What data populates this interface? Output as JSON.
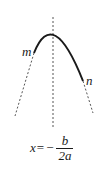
{
  "diagram": {
    "type": "parabola-axis-of-symmetry",
    "colors": {
      "curve": "#1a1a1a",
      "dashed": "#555555",
      "text": "#1a1a1a",
      "background": "#ffffff"
    },
    "labels": {
      "left_point": "m",
      "right_point": "n"
    },
    "axis_formula": {
      "lhs": "x",
      "equals": "=",
      "sign": "−",
      "numerator": "b",
      "denominator": "2a"
    }
  }
}
